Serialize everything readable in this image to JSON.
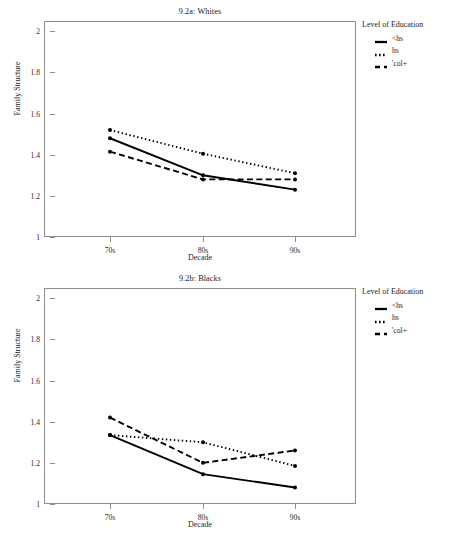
{
  "axis": {
    "xlabel": "Decade",
    "ylabel": "Family Structure",
    "x_ticks": [
      "70s",
      "80s",
      "90s"
    ],
    "y_ticks": [
      "1",
      "1.2",
      "1.4",
      "1.6",
      "1.8",
      "2"
    ]
  },
  "legend": {
    "title": "Level of Education",
    "items": [
      {
        "label": "<hs",
        "style": "solid"
      },
      {
        "label": "hs",
        "style": "dotted"
      },
      {
        "label": "'col+",
        "style": "dashed"
      }
    ]
  },
  "chart_data": [
    {
      "type": "line",
      "title": "9.2a: Whites",
      "xlabel": "Decade",
      "ylabel": "Family Structure",
      "categories": [
        "70s",
        "80s",
        "90s"
      ],
      "ylim": [
        1,
        2.05
      ],
      "yticks": [
        1,
        1.2,
        1.4,
        1.6,
        1.8,
        2
      ],
      "grid": false,
      "legend_position": "right",
      "legend_title": "Level of Education",
      "series": [
        {
          "name": "<hs",
          "style": "solid",
          "values": [
            1.48,
            1.3,
            1.23
          ]
        },
        {
          "name": "hs",
          "style": "dotted",
          "values": [
            1.52,
            1.405,
            1.31
          ]
        },
        {
          "name": "'col+",
          "style": "dashed",
          "values": [
            1.415,
            1.28,
            1.28
          ]
        }
      ]
    },
    {
      "type": "line",
      "title": "9.2b: Blacks",
      "xlabel": "Decade",
      "ylabel": "Family Structure",
      "categories": [
        "70s",
        "80s",
        "90s"
      ],
      "ylim": [
        1,
        2.05
      ],
      "yticks": [
        1,
        1.2,
        1.4,
        1.6,
        1.8,
        2
      ],
      "grid": false,
      "legend_position": "right",
      "legend_title": "Level of Education",
      "series": [
        {
          "name": "<hs",
          "style": "solid",
          "values": [
            1.335,
            1.145,
            1.08
          ]
        },
        {
          "name": "hs",
          "style": "dotted",
          "values": [
            1.335,
            1.3,
            1.185
          ]
        },
        {
          "name": "'col+",
          "style": "dashed",
          "values": [
            1.42,
            1.2,
            1.26
          ]
        }
      ]
    }
  ],
  "colors": {
    "line": "#000000",
    "frame": "#8d8d8d",
    "text": "#232323"
  }
}
